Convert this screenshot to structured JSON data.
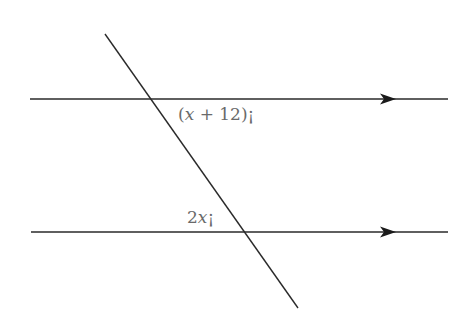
{
  "diagram": {
    "type": "parallel-lines-transversal",
    "lines": {
      "top": {
        "x1": 30,
        "y1": 99,
        "x2": 448,
        "y2": 99,
        "arrow_at_x": 385
      },
      "bottom": {
        "x1": 31,
        "y1": 232,
        "x2": 448,
        "y2": 232,
        "arrow_at_x": 385
      },
      "transversal": {
        "x1": 105,
        "y1": 34,
        "x2": 298,
        "y2": 308
      }
    },
    "labels": {
      "top_angle": {
        "prefix": "(",
        "var": "x",
        "rest": " + 12)",
        "degree": "¡"
      },
      "bottom_angle": {
        "prefix": "2",
        "var": "x",
        "rest": "",
        "degree": "¡"
      }
    },
    "colors": {
      "line": "#2a2a2a",
      "label": "#6a6a6a",
      "background": "#ffffff"
    }
  }
}
